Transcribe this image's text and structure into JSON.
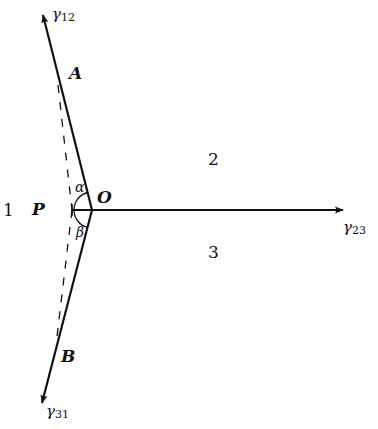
{
  "diagram": {
    "colors": {
      "line": "#111111",
      "background": "#ffffff"
    },
    "origin": {
      "label": "O",
      "x": 92,
      "y": 210
    },
    "vectors": [
      {
        "id": "gamma12",
        "label_base": "γ",
        "label_sub": "12",
        "from": [
          92,
          210
        ],
        "to": [
          42,
          12
        ]
      },
      {
        "id": "gamma23",
        "label_base": "γ",
        "label_sub": "23",
        "from": [
          92,
          210
        ],
        "to": [
          344,
          210
        ]
      },
      {
        "id": "gamma31",
        "label_base": "γ",
        "label_sub": "31",
        "from": [
          92,
          210
        ],
        "to": [
          41,
          406
        ]
      }
    ],
    "points": [
      {
        "label": "A",
        "x": 58,
        "y": 85
      },
      {
        "label": "B",
        "x": 56,
        "y": 345
      },
      {
        "label": "P",
        "x": 72,
        "y": 210
      }
    ],
    "dashed_lines": [
      {
        "from": [
          58,
          85
        ],
        "to": [
          72,
          210
        ]
      },
      {
        "from": [
          72,
          210
        ],
        "to": [
          56,
          345
        ]
      }
    ],
    "angles": [
      {
        "label": "α",
        "between": [
          "gamma12",
          "PO"
        ]
      },
      {
        "label": "β",
        "between": [
          "gamma31",
          "PO"
        ]
      }
    ],
    "regions": [
      {
        "label": "1"
      },
      {
        "label": "2"
      },
      {
        "label": "3"
      }
    ]
  },
  "labels": {
    "gamma": "γ",
    "sub12": "12",
    "sub23": "23",
    "sub31": "31",
    "A": "A",
    "B": "B",
    "O": "O",
    "P": "P",
    "alpha": "α",
    "beta": "β",
    "region1": "1",
    "region2": "2",
    "region3": "3"
  }
}
